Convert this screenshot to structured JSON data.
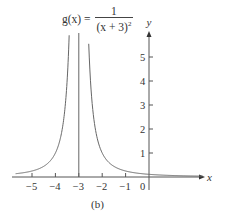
{
  "chart_data": {
    "type": "line",
    "function": "g(x) = 1 / (x + 3)^2",
    "xlabel": "x",
    "ylabel": "y",
    "xlim": [
      -6,
      2.3
    ],
    "ylim": [
      -0.4,
      6
    ],
    "x_ticks": [
      -5,
      -4,
      -3,
      -2,
      -1,
      0
    ],
    "x_tick_labels": [
      "−5",
      "−4",
      "−3",
      "−2",
      "−1",
      "0"
    ],
    "y_ticks": [
      1,
      2,
      3,
      4,
      5
    ],
    "y_tick_labels": [
      "1",
      "2",
      "3",
      "4",
      "5"
    ],
    "vertical_asymptote": -3,
    "horizontal_asymptote": 0,
    "grid": false,
    "legend": null,
    "caption": "(b)",
    "series": [
      {
        "name": "g(x)",
        "x": [
          -5.7,
          -5,
          -4.5,
          -4,
          -3.6,
          -3.4,
          -2.6,
          -2.4,
          -2,
          -1.5,
          -1,
          0,
          1,
          2.3
        ],
        "values": [
          0.137,
          0.25,
          0.444,
          1.0,
          2.778,
          6.25,
          6.25,
          2.778,
          1.0,
          0.444,
          0.25,
          0.111,
          0.0625,
          0.036
        ]
      }
    ]
  },
  "formula": {
    "lhs": "g(x) =",
    "numerator": "1",
    "denominator": "(x + 3)",
    "exponent": "2"
  },
  "axes": {
    "x_label": "x",
    "y_label": "y"
  },
  "caption": "(b)"
}
